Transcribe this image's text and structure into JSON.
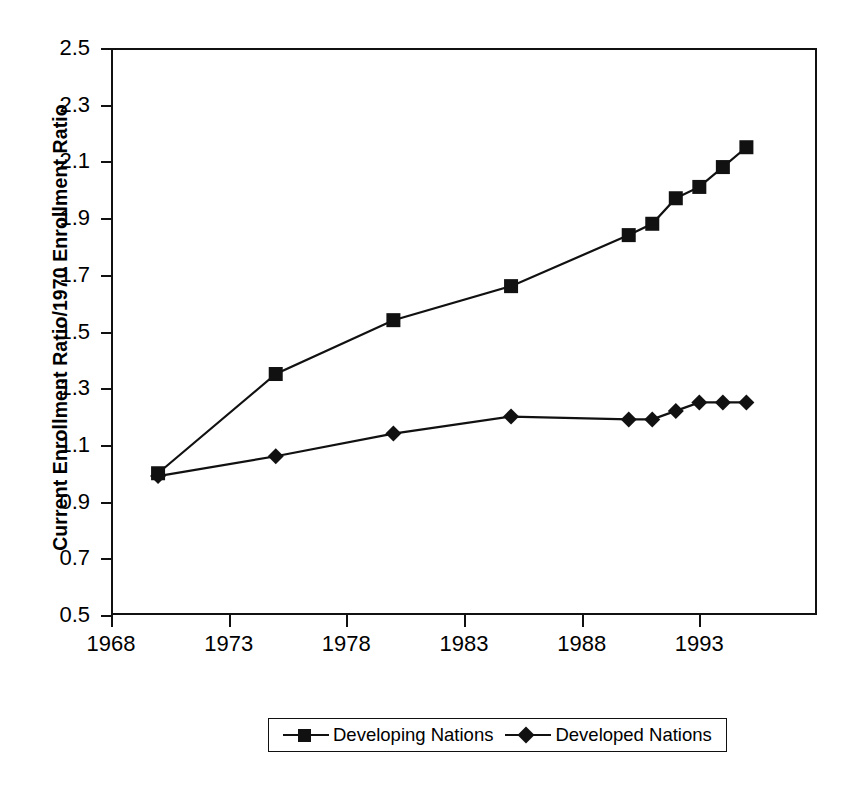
{
  "chart_data": {
    "type": "line",
    "title": "",
    "subtitle": "",
    "xlabel": "",
    "ylabel": "Current Enrollment Ratio/1970 Enrollment Ratio",
    "xlim": [
      1968,
      1998
    ],
    "ylim": [
      0.5,
      2.5
    ],
    "xticks": [
      1968,
      1973,
      1978,
      1983,
      1988,
      1993
    ],
    "xtick_labels": [
      "1968",
      "1973",
      "1978",
      "1983",
      "1988",
      "1993"
    ],
    "yticks": [
      0.5,
      0.7,
      0.9,
      1.1,
      1.3,
      1.5,
      1.7,
      1.9,
      2.1,
      2.3,
      2.5
    ],
    "ytick_labels": [
      "0.5",
      "0.7",
      "0.9",
      "1.1",
      "1.3",
      "1.5",
      "1.7",
      "1.9",
      "2.1",
      "2.3",
      "2.5"
    ],
    "grid": false,
    "legend_position": "bottom-center",
    "line_color": "#111111",
    "series": [
      {
        "name": "Developing Nations",
        "marker": "square",
        "color": "#111111",
        "x": [
          1970,
          1975,
          1980,
          1985,
          1990,
          1991,
          1992,
          1993,
          1994,
          1995
        ],
        "values": [
          1.0,
          1.35,
          1.54,
          1.66,
          1.84,
          1.88,
          1.97,
          2.01,
          2.08,
          2.15
        ]
      },
      {
        "name": "Developed Nations",
        "marker": "diamond",
        "color": "#111111",
        "x": [
          1970,
          1975,
          1980,
          1985,
          1990,
          1991,
          1992,
          1993,
          1994,
          1995
        ],
        "values": [
          0.99,
          1.06,
          1.14,
          1.2,
          1.19,
          1.19,
          1.22,
          1.25,
          1.25,
          1.25
        ]
      }
    ]
  },
  "legend": {
    "entries": [
      {
        "label": "Developing Nations",
        "marker": "square"
      },
      {
        "label": "Developed Nations",
        "marker": "diamond"
      }
    ]
  }
}
